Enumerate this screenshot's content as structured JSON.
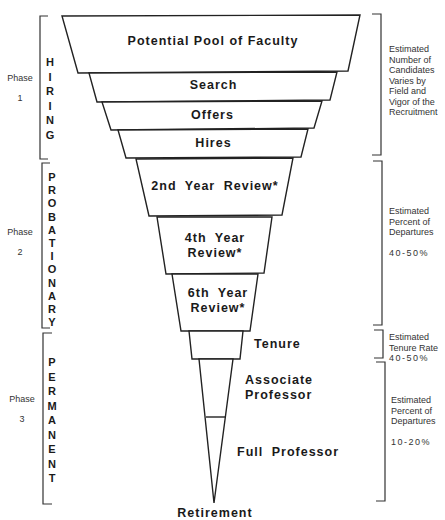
{
  "funnel": {
    "stages": [
      {
        "label": "Potential Pool of Faculty"
      },
      {
        "label": "Search"
      },
      {
        "label": "Offers"
      },
      {
        "label": "Hires"
      },
      {
        "label": "2nd Year Review*"
      },
      {
        "label": "4th Year",
        "label2": "Review*"
      },
      {
        "label": "6th Year",
        "label2": "Review*"
      },
      {
        "label": "Tenure"
      },
      {
        "label": "Associate",
        "label2": "Professor"
      },
      {
        "label": "Full Professor"
      }
    ],
    "end_label": "Retirement"
  },
  "phases": [
    {
      "phase_label": "Phase",
      "number": "1",
      "name": "HIRING",
      "letters": [
        "H",
        "I",
        "R",
        "I",
        "N",
        "G"
      ]
    },
    {
      "phase_label": "Phase",
      "number": "2",
      "name": "PROBATIONARY",
      "letters": [
        "P",
        "R",
        "O",
        "B",
        "A",
        "T",
        "I",
        "O",
        "N",
        "A",
        "R",
        "Y"
      ]
    },
    {
      "phase_label": "Phase",
      "number": "3",
      "name": "PERMANENT",
      "letters": [
        "P",
        "E",
        "R",
        "M",
        "A",
        "N",
        "E",
        "N",
        "T"
      ]
    }
  ],
  "notes": [
    {
      "lines": [
        "Estimated",
        "Number of",
        "Candidates",
        "Varies by",
        "Field and",
        "Vigor of the",
        "Recruitment"
      ]
    },
    {
      "lines": [
        "Estimated",
        "Percent of",
        "Departures"
      ],
      "value": "40-50%"
    },
    {
      "lines": [
        "Estimated",
        "Tenure Rate"
      ],
      "value": "40-50%"
    },
    {
      "lines": [
        "Estimated",
        "Percent of",
        "Departures"
      ],
      "value": "10-20%"
    }
  ]
}
